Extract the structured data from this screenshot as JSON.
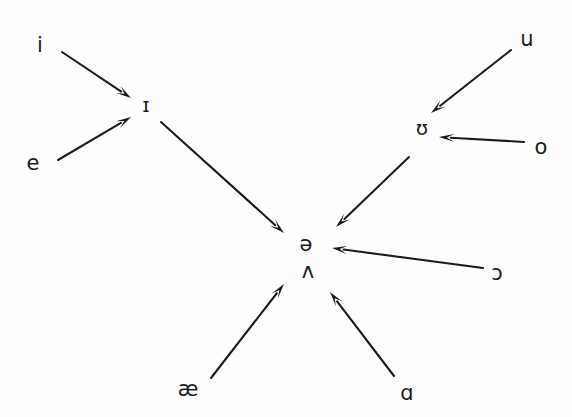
{
  "figure": {
    "type": "vowel-reduction-diagram",
    "background_color": "#fefefe",
    "ink_color": "#1b1b1b",
    "width": 572,
    "height": 417
  },
  "nodes": [
    {
      "id": "i",
      "label": "i",
      "x": 40,
      "y": 45,
      "size": 21
    },
    {
      "id": "small_i",
      "label": "ɪ",
      "x": 146,
      "y": 105,
      "size": 20
    },
    {
      "id": "e",
      "label": "e",
      "x": 33,
      "y": 163,
      "size": 21
    },
    {
      "id": "u",
      "label": "u",
      "x": 527,
      "y": 39,
      "size": 21
    },
    {
      "id": "upsilon",
      "label": "ʊ",
      "x": 422,
      "y": 128,
      "size": 20
    },
    {
      "id": "o",
      "label": "o",
      "x": 541,
      "y": 147,
      "size": 21
    },
    {
      "id": "schwa",
      "label": "ə",
      "x": 306,
      "y": 244,
      "size": 21
    },
    {
      "id": "wedge",
      "label": "ʌ",
      "x": 308,
      "y": 271,
      "size": 21
    },
    {
      "id": "openo",
      "label": "ɔ",
      "x": 497,
      "y": 273,
      "size": 21
    },
    {
      "id": "ash",
      "label": "æ",
      "x": 188,
      "y": 389,
      "size": 21
    },
    {
      "id": "scripta",
      "label": "ɑ",
      "x": 407,
      "y": 393,
      "size": 21
    }
  ],
  "arrows": [
    {
      "id": "i-to-smalli",
      "from": "i",
      "to": "small_i",
      "x1": 62,
      "y1": 52,
      "x2": 131,
      "y2": 98
    },
    {
      "id": "e-to-smalli",
      "from": "e",
      "to": "small_i",
      "x1": 58,
      "y1": 160,
      "x2": 131,
      "y2": 117
    },
    {
      "id": "smalli-to-schwa",
      "from": "small_i",
      "to": "schwa",
      "x1": 161,
      "y1": 122,
      "x2": 284,
      "y2": 233
    },
    {
      "id": "u-to-upsilon",
      "from": "u",
      "to": "upsilon",
      "x1": 511,
      "y1": 50,
      "x2": 431,
      "y2": 113
    },
    {
      "id": "o-to-upsilon",
      "from": "o",
      "to": "upsilon",
      "x1": 524,
      "y1": 142,
      "x2": 439,
      "y2": 137
    },
    {
      "id": "upsilon-to-schwa",
      "from": "upsilon",
      "to": "schwa",
      "x1": 409,
      "y1": 157,
      "x2": 336,
      "y2": 227
    },
    {
      "id": "openo-to-schwa",
      "from": "openo",
      "to": "schwa",
      "x1": 483,
      "y1": 268,
      "x2": 332,
      "y2": 248
    },
    {
      "id": "ash-to-wedge",
      "from": "ash",
      "to": "wedge",
      "x1": 211,
      "y1": 378,
      "x2": 284,
      "y2": 284
    },
    {
      "id": "scripta-to-wedge",
      "from": "scripta",
      "to": "wedge",
      "x1": 394,
      "y1": 376,
      "x2": 330,
      "y2": 292
    }
  ]
}
